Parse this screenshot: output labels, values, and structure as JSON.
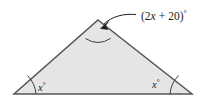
{
  "figure": {
    "type": "geometry-diagram",
    "shape": "triangle",
    "fill_color": "#e5e5e5",
    "stroke_color": "#555555",
    "text_color": "#1b1b1b",
    "background_color": "#ffffff",
    "vertices": {
      "apex": {
        "x": 98,
        "y": 20
      },
      "base_left": {
        "x": 14,
        "y": 94
      },
      "base_right": {
        "x": 192,
        "y": 94
      }
    },
    "labels": {
      "apex_angle": {
        "full": "(2x + 20)°",
        "open_paren": "(",
        "coefficient": "2",
        "variable": "x",
        "operator": "+",
        "constant": "20",
        "close_paren": ")",
        "degree": "°"
      },
      "base_left_angle": {
        "full": "x°",
        "variable": "x",
        "degree": "°"
      },
      "base_right_angle": {
        "full": "x°",
        "variable": "x",
        "degree": "°"
      }
    },
    "annotations": {
      "leader_line": "curved-pointer-to-apex",
      "arrowhead": "arrowhead-icon"
    }
  }
}
